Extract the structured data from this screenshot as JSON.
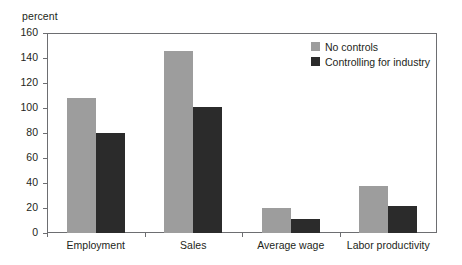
{
  "chart_data": {
    "type": "bar",
    "title": "",
    "subtitle": "",
    "xlabel": "",
    "ylabel": "percent",
    "ylim": [
      0,
      160
    ],
    "yticks": [
      0,
      20,
      40,
      60,
      80,
      100,
      120,
      140,
      160
    ],
    "grid": false,
    "legend_position": "top-right",
    "categories": [
      "Employment",
      "Sales",
      "Average wage",
      "Labor productivity"
    ],
    "series": [
      {
        "name": "No controls",
        "color": "#9d9d9d",
        "values": [
          108,
          146,
          20,
          38
        ]
      },
      {
        "name": "Controlling for industry",
        "color": "#2b2b2b",
        "values": [
          80,
          101,
          11,
          22
        ]
      }
    ]
  },
  "colors": {
    "series_no_controls": "#9d9d9d",
    "series_controlling": "#2b2b2b",
    "axis": "#6d6e71",
    "text": "#231f20",
    "background": "#ffffff"
  }
}
